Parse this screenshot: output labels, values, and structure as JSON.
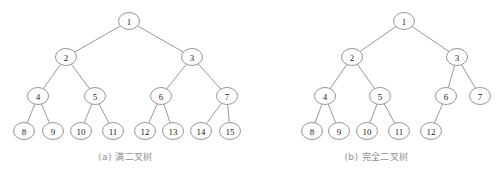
{
  "figure": {
    "background_color": "#ffffff",
    "node_stroke_color": "#8a8a8a",
    "edge_stroke_color": "#8d8d8d",
    "label_color": "#1a1a1a",
    "caption_color": "#8f8f8f"
  },
  "trees": [
    {
      "id": "full-binary-tree",
      "caption": "(a) 满二叉树",
      "node_rx": 10.5,
      "node_ry": 8.5,
      "nodes": [
        {
          "label": "1",
          "x": 129,
          "y": 21
        },
        {
          "label": "2",
          "x": 66,
          "y": 57
        },
        {
          "label": "3",
          "x": 192,
          "y": 57
        },
        {
          "label": "4",
          "x": 38,
          "y": 96
        },
        {
          "label": "5",
          "x": 95,
          "y": 96
        },
        {
          "label": "6",
          "x": 161,
          "y": 96
        },
        {
          "label": "7",
          "x": 227,
          "y": 96
        },
        {
          "label": "8",
          "x": 24,
          "y": 131
        },
        {
          "label": "9",
          "x": 53,
          "y": 131
        },
        {
          "label": "10",
          "x": 81,
          "y": 131
        },
        {
          "label": "11",
          "x": 113,
          "y": 131
        },
        {
          "label": "12",
          "x": 145,
          "y": 131
        },
        {
          "label": "13",
          "x": 173,
          "y": 131
        },
        {
          "label": "14",
          "x": 201,
          "y": 131
        },
        {
          "label": "15",
          "x": 230,
          "y": 131
        }
      ],
      "edges": [
        {
          "from": "1",
          "to": "2"
        },
        {
          "from": "1",
          "to": "3"
        },
        {
          "from": "2",
          "to": "4"
        },
        {
          "from": "2",
          "to": "5"
        },
        {
          "from": "3",
          "to": "6"
        },
        {
          "from": "3",
          "to": "7"
        },
        {
          "from": "4",
          "to": "8"
        },
        {
          "from": "4",
          "to": "9"
        },
        {
          "from": "5",
          "to": "10"
        },
        {
          "from": "5",
          "to": "11"
        },
        {
          "from": "6",
          "to": "12"
        },
        {
          "from": "6",
          "to": "13"
        },
        {
          "from": "7",
          "to": "14"
        },
        {
          "from": "7",
          "to": "15"
        }
      ]
    },
    {
      "id": "complete-binary-tree",
      "caption": "(b) 完全二叉树",
      "node_rx": 10.5,
      "node_ry": 8.5,
      "nodes": [
        {
          "label": "1",
          "x": 404,
          "y": 21
        },
        {
          "label": "2",
          "x": 352,
          "y": 57
        },
        {
          "label": "3",
          "x": 457,
          "y": 57
        },
        {
          "label": "4",
          "x": 325,
          "y": 96
        },
        {
          "label": "5",
          "x": 380,
          "y": 96
        },
        {
          "label": "6",
          "x": 446,
          "y": 96
        },
        {
          "label": "7",
          "x": 480,
          "y": 96
        },
        {
          "label": "8",
          "x": 312,
          "y": 131
        },
        {
          "label": "9",
          "x": 339,
          "y": 131
        },
        {
          "label": "10",
          "x": 367,
          "y": 131
        },
        {
          "label": "11",
          "x": 399,
          "y": 131
        },
        {
          "label": "12",
          "x": 431,
          "y": 131
        }
      ],
      "edges": [
        {
          "from": "1",
          "to": "2"
        },
        {
          "from": "1",
          "to": "3"
        },
        {
          "from": "2",
          "to": "4"
        },
        {
          "from": "2",
          "to": "5"
        },
        {
          "from": "3",
          "to": "6"
        },
        {
          "from": "3",
          "to": "7"
        },
        {
          "from": "4",
          "to": "8"
        },
        {
          "from": "4",
          "to": "9"
        },
        {
          "from": "5",
          "to": "10"
        },
        {
          "from": "5",
          "to": "11"
        },
        {
          "from": "6",
          "to": "12"
        }
      ]
    }
  ]
}
